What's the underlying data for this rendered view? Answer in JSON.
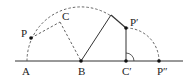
{
  "diagram": {
    "type": "geometry-rotation",
    "colors": {
      "line": "#333333",
      "dashed": "#555555",
      "background": "#ffffff"
    },
    "points": [
      {
        "id": "A",
        "label": "A",
        "x": 27,
        "y": 61
      },
      {
        "id": "B",
        "label": "B",
        "x": 81,
        "y": 61
      },
      {
        "id": "C",
        "label": "C",
        "x": 60,
        "y": 22
      },
      {
        "id": "P",
        "label": "P",
        "x": 31,
        "y": 38
      },
      {
        "id": "P1",
        "label": "P′",
        "x": 126,
        "y": 28
      },
      {
        "id": "C1",
        "label": "C′",
        "x": 126,
        "y": 61
      },
      {
        "id": "P2",
        "label": "P″",
        "x": 159,
        "y": 61
      }
    ],
    "labels": {
      "A": "A",
      "B": "B",
      "C": "C",
      "P": "P",
      "P1": "P′",
      "C1": "C′",
      "P2": "P″"
    },
    "right_angle_at": "C′"
  }
}
